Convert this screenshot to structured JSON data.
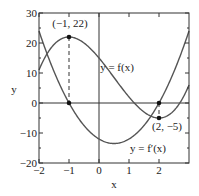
{
  "chart_data": {
    "type": "line",
    "title": "",
    "xlabel": "x",
    "ylabel": "y",
    "xlim": [
      -2,
      3
    ],
    "ylim": [
      -20,
      30
    ],
    "xticks": [
      -2,
      -1,
      0,
      1,
      2
    ],
    "xtick_labels": [
      "−2",
      "−1",
      "0",
      "1",
      "2"
    ],
    "yticks": [
      -20,
      -10,
      0,
      10,
      20,
      30
    ],
    "ytick_labels": [
      "−20",
      "−10",
      "0",
      "10",
      "20",
      "30"
    ],
    "grid": false,
    "series": [
      {
        "name": "y = f(x)",
        "formula": "2x^3 - 3x^2 - 12x + 15",
        "coefficients": [
          2,
          -3,
          -12,
          15
        ]
      },
      {
        "name": "y = f′(x)",
        "formula": "6x^2 - 6x - 12",
        "coefficients": [
          6,
          -6,
          -12
        ]
      }
    ],
    "annotations": [
      {
        "text": "(−1, 22)",
        "x": -1,
        "y": 22
      },
      {
        "text": "(2, −5)",
        "x": 2,
        "y": -5
      },
      {
        "text": "y = f(x)"
      },
      {
        "text": "y = f′(x)"
      }
    ],
    "marked_points": [
      {
        "x": -1,
        "y": 22
      },
      {
        "x": -1,
        "y": 0
      },
      {
        "x": 2,
        "y": 0
      },
      {
        "x": 2,
        "y": -5
      }
    ],
    "dashed_verticals": [
      -1,
      2
    ]
  }
}
